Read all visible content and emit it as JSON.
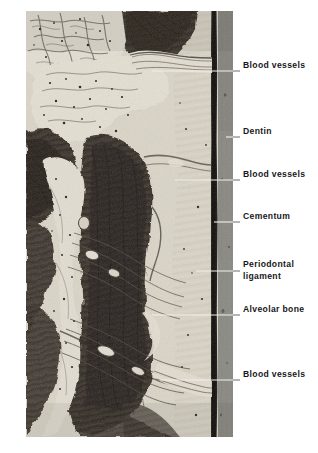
{
  "figure": {
    "kind": "histological-micrograph",
    "plate": {
      "left": 26,
      "top": 11,
      "width": 207,
      "height": 426,
      "background_hex": "#8a8a86"
    },
    "palette": {
      "page_background": "#ffffff",
      "label_text": "#17171a",
      "leader_line_over_tissue": "#f2f0ea",
      "leader_line_over_page": "#5c5c5c",
      "bone_dark": "#3c342e",
      "bone_darker": "#241f1b",
      "ligament_light": "#e9e4d8",
      "dentin_grey": "#8d8c87",
      "cementum_black": "#141210",
      "marrow_pale": "#efeade"
    }
  },
  "labels": [
    {
      "id": "blood-vessels-top",
      "text": "Blood vessels",
      "text_x": 243,
      "text_y": 66,
      "lines": 1,
      "leader": {
        "x1": 152,
        "y1": 71,
        "x2": 240,
        "y2": 71,
        "split_at": 233
      }
    },
    {
      "id": "dentin",
      "text": "Dentin",
      "text_x": 243,
      "text_y": 132,
      "lines": 1,
      "leader": {
        "x1": 226,
        "y1": 137,
        "x2": 240,
        "y2": 137,
        "split_at": 233
      }
    },
    {
      "id": "blood-vessels-middle",
      "text": "Blood vessels",
      "text_x": 243,
      "text_y": 175,
      "lines": 1,
      "leader": {
        "x1": 175,
        "y1": 180,
        "x2": 240,
        "y2": 180,
        "split_at": 233
      }
    },
    {
      "id": "cementum",
      "text": "Cementum",
      "text_x": 243,
      "text_y": 217,
      "lines": 1,
      "leader": {
        "x1": 214,
        "y1": 222,
        "x2": 240,
        "y2": 222,
        "split_at": 233
      }
    },
    {
      "id": "periodontal-ligament",
      "text": "Periodontal\nligament",
      "text_x": 243,
      "text_y": 265,
      "lines": 2,
      "leader": {
        "x1": 196,
        "y1": 271,
        "x2": 240,
        "y2": 271,
        "split_at": 233
      }
    },
    {
      "id": "alveolar-bone",
      "text": "Alveolar bone",
      "text_x": 243,
      "text_y": 310,
      "lines": 1,
      "leader": {
        "x1": 152,
        "y1": 315,
        "x2": 240,
        "y2": 315,
        "split_at": 233
      }
    },
    {
      "id": "blood-vessels-bottom",
      "text": "Blood vessels",
      "text_x": 243,
      "text_y": 375,
      "lines": 1,
      "leader": {
        "x1": 160,
        "y1": 380,
        "x2": 240,
        "y2": 380,
        "split_at": 233
      }
    }
  ],
  "structures": [
    {
      "name": "marrow-space-upper",
      "tone": "pale",
      "note": "trabecular marrow with vascular channels, upper left"
    },
    {
      "name": "alveolar-bone-upper-right",
      "tone": "dark",
      "note": "dark bone mass at top right of plate"
    },
    {
      "name": "alveolar-bone-lower-left",
      "tone": "dark",
      "note": "dark bone mass at lower left of plate"
    },
    {
      "name": "alveolar-bone-central",
      "tone": "dark",
      "note": "large dark bone column centre-right"
    },
    {
      "name": "periodontal-ligament-band",
      "tone": "light",
      "note": "pale fibrous band running vertically beside cementum"
    },
    {
      "name": "cementum-line",
      "tone": "black",
      "note": "thin dark vertical band at right of ligament"
    },
    {
      "name": "dentin-field",
      "tone": "grey",
      "note": "uniform grey field at far right of plate"
    },
    {
      "name": "vascular-bundle-upper",
      "tone": "light",
      "note": "horizontal vessel bundle crossing ligament near top"
    },
    {
      "name": "vascular-bundle-middle",
      "tone": "light",
      "note": "fanned vessel fibres mid plate"
    },
    {
      "name": "vascular-bundle-lower",
      "tone": "light",
      "note": "fanned vessel fibres lower plate"
    }
  ]
}
